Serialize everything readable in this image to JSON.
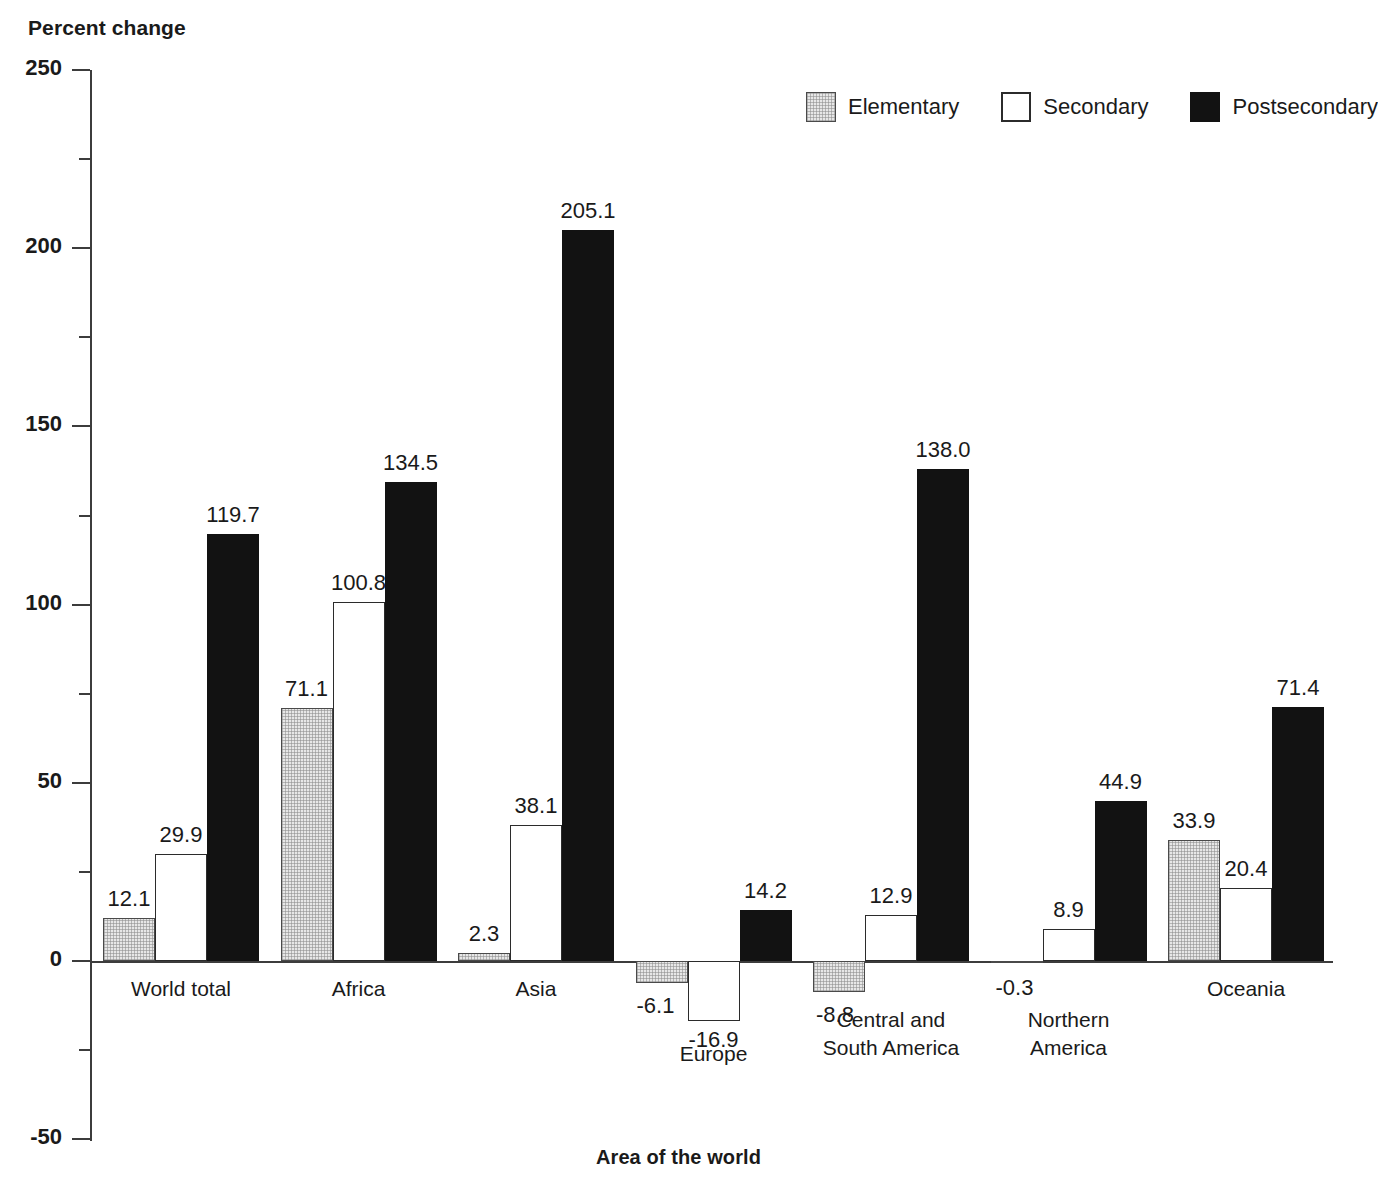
{
  "chart_data": {
    "type": "bar",
    "title": "",
    "ylabel": "Percent change",
    "xlabel": "Area of the world",
    "ylim": [
      -50,
      250
    ],
    "ytick_values": [
      250,
      200,
      150,
      100,
      50,
      0,
      -50
    ],
    "ytick_labels": [
      "250",
      "200",
      "150",
      "100",
      "50",
      "0",
      "-50"
    ],
    "yminor_step": 25,
    "grid": false,
    "legend_position": "top-right",
    "categories": [
      "World total",
      "Africa",
      "Asia",
      "Europe",
      "Central and\nSouth America",
      "Northern\nAmerica",
      "Oceania"
    ],
    "series": [
      {
        "name": "Elementary",
        "color": "#e7e7e7",
        "values": [
          12.1,
          71.1,
          2.3,
          -6.1,
          -8.8,
          -0.3,
          33.9
        ],
        "labels": [
          "12.1",
          "71.1",
          "2.3",
          "-6.1",
          "-8.8",
          "-0.3",
          "33.9"
        ]
      },
      {
        "name": "Secondary",
        "color": "#ffffff",
        "values": [
          29.9,
          100.8,
          38.1,
          -16.9,
          12.9,
          8.9,
          20.4
        ],
        "labels": [
          "29.9",
          "100.8",
          "38.1",
          "-16.9",
          "12.9",
          "8.9",
          "20.4"
        ]
      },
      {
        "name": "Postsecondary",
        "color": "#121212",
        "values": [
          119.7,
          134.5,
          205.1,
          14.2,
          138.0,
          44.9,
          71.4
        ],
        "labels": [
          "119.7",
          "134.5",
          "205.1",
          "14.2",
          "138.0",
          "44.9",
          "71.4"
        ]
      }
    ]
  },
  "legend": {
    "items": [
      {
        "label": "Elementary",
        "swatch": "elementary"
      },
      {
        "label": "Secondary",
        "swatch": "secondary"
      },
      {
        "label": "Postsecondary",
        "swatch": "postsecondary"
      }
    ]
  },
  "category_labels": [
    {
      "lines": [
        "World total"
      ]
    },
    {
      "lines": [
        "Africa"
      ]
    },
    {
      "lines": [
        "Asia"
      ]
    },
    {
      "lines": [
        "Europe"
      ]
    },
    {
      "lines": [
        "Central and",
        "South America"
      ]
    },
    {
      "lines": [
        "Northern",
        "America"
      ]
    },
    {
      "lines": [
        "Oceania"
      ]
    }
  ]
}
